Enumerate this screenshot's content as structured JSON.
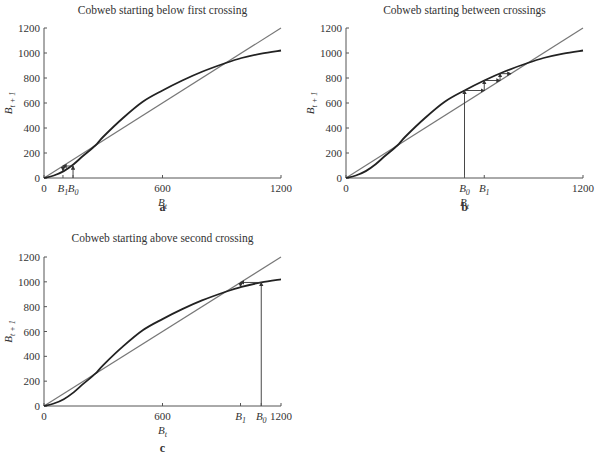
{
  "chart_data": [
    {
      "id": "a",
      "type": "line",
      "title": "Cobweb starting below first crossing",
      "caption": "a",
      "xlabel": "B_t",
      "ylabel": "B_{t+1}",
      "xlim": [
        0,
        1200
      ],
      "ylim": [
        0,
        1200
      ],
      "xticks": [
        0,
        600,
        1200
      ],
      "yticks": [
        0,
        200,
        400,
        600,
        800,
        1000,
        1200
      ],
      "grid": false,
      "series": [
        {
          "name": "recruitment curve",
          "x": [
            0,
            50,
            100,
            150,
            200,
            260,
            300,
            400,
            500,
            600,
            700,
            800,
            920,
            1000,
            1100,
            1200
          ],
          "y": [
            0,
            20,
            55,
            110,
            180,
            260,
            330,
            480,
            610,
            700,
            780,
            850,
            920,
            960,
            995,
            1020
          ]
        },
        {
          "name": "replacement line",
          "x": [
            0,
            1200
          ],
          "y": [
            0,
            1200
          ]
        }
      ],
      "markers": [
        {
          "label": "B_1",
          "x": 96
        },
        {
          "label": "B_0",
          "x": 147
        }
      ],
      "cobweb": [
        [
          147,
          0
        ],
        [
          147,
          96
        ],
        [
          96,
          96
        ],
        [
          96,
          58
        ]
      ]
    },
    {
      "id": "b",
      "type": "line",
      "title": "Cobweb starting between crossings",
      "caption": "b",
      "xlabel": "B_t",
      "ylabel": "B_{t+1}",
      "xlim": [
        0,
        1200
      ],
      "ylim": [
        0,
        1200
      ],
      "xticks": [
        0,
        1200
      ],
      "yticks": [
        0,
        200,
        400,
        600,
        800,
        1000,
        1200
      ],
      "grid": false,
      "series": [
        {
          "name": "recruitment curve",
          "x": [
            0,
            50,
            100,
            150,
            200,
            260,
            300,
            400,
            500,
            600,
            700,
            800,
            920,
            1000,
            1100,
            1200
          ],
          "y": [
            0,
            20,
            55,
            110,
            180,
            260,
            330,
            480,
            610,
            700,
            780,
            850,
            920,
            960,
            995,
            1020
          ]
        },
        {
          "name": "replacement line",
          "x": [
            0,
            1200
          ],
          "y": [
            0,
            1200
          ]
        }
      ],
      "markers": [
        {
          "label": "B_0",
          "x": 600
        },
        {
          "label": "B_1",
          "x": 700
        }
      ],
      "cobweb": [
        [
          600,
          0
        ],
        [
          600,
          700
        ],
        [
          700,
          700
        ],
        [
          700,
          780
        ],
        [
          780,
          780
        ],
        [
          780,
          835
        ],
        [
          835,
          835
        ]
      ]
    },
    {
      "id": "c",
      "type": "line",
      "title": "Cobweb starting above second crossing",
      "caption": "c",
      "xlabel": "B_t",
      "ylabel": "B_{t+1}",
      "xlim": [
        0,
        1200
      ],
      "ylim": [
        0,
        1200
      ],
      "xticks": [
        0,
        600,
        1200
      ],
      "yticks": [
        0,
        200,
        400,
        600,
        800,
        1000,
        1200
      ],
      "grid": false,
      "series": [
        {
          "name": "recruitment curve",
          "x": [
            0,
            50,
            100,
            150,
            200,
            260,
            300,
            400,
            500,
            600,
            700,
            800,
            920,
            1000,
            1100,
            1200
          ],
          "y": [
            0,
            20,
            55,
            110,
            180,
            260,
            330,
            480,
            610,
            700,
            780,
            850,
            920,
            960,
            995,
            1020
          ]
        },
        {
          "name": "replacement line",
          "x": [
            0,
            1200
          ],
          "y": [
            0,
            1200
          ]
        }
      ],
      "markers": [
        {
          "label": "B_1",
          "x": 995
        },
        {
          "label": "B_0",
          "x": 1100
        }
      ],
      "cobweb": [
        [
          1100,
          0
        ],
        [
          1100,
          995
        ],
        [
          995,
          995
        ],
        [
          995,
          962
        ]
      ]
    }
  ],
  "panels": {
    "a": {
      "title": "Cobweb starting below first crossing",
      "caption": "a"
    },
    "b": {
      "title": "Cobweb starting between crossings",
      "caption": "b"
    },
    "c": {
      "title": "Cobweb starting above second crossing",
      "caption": "c"
    }
  }
}
